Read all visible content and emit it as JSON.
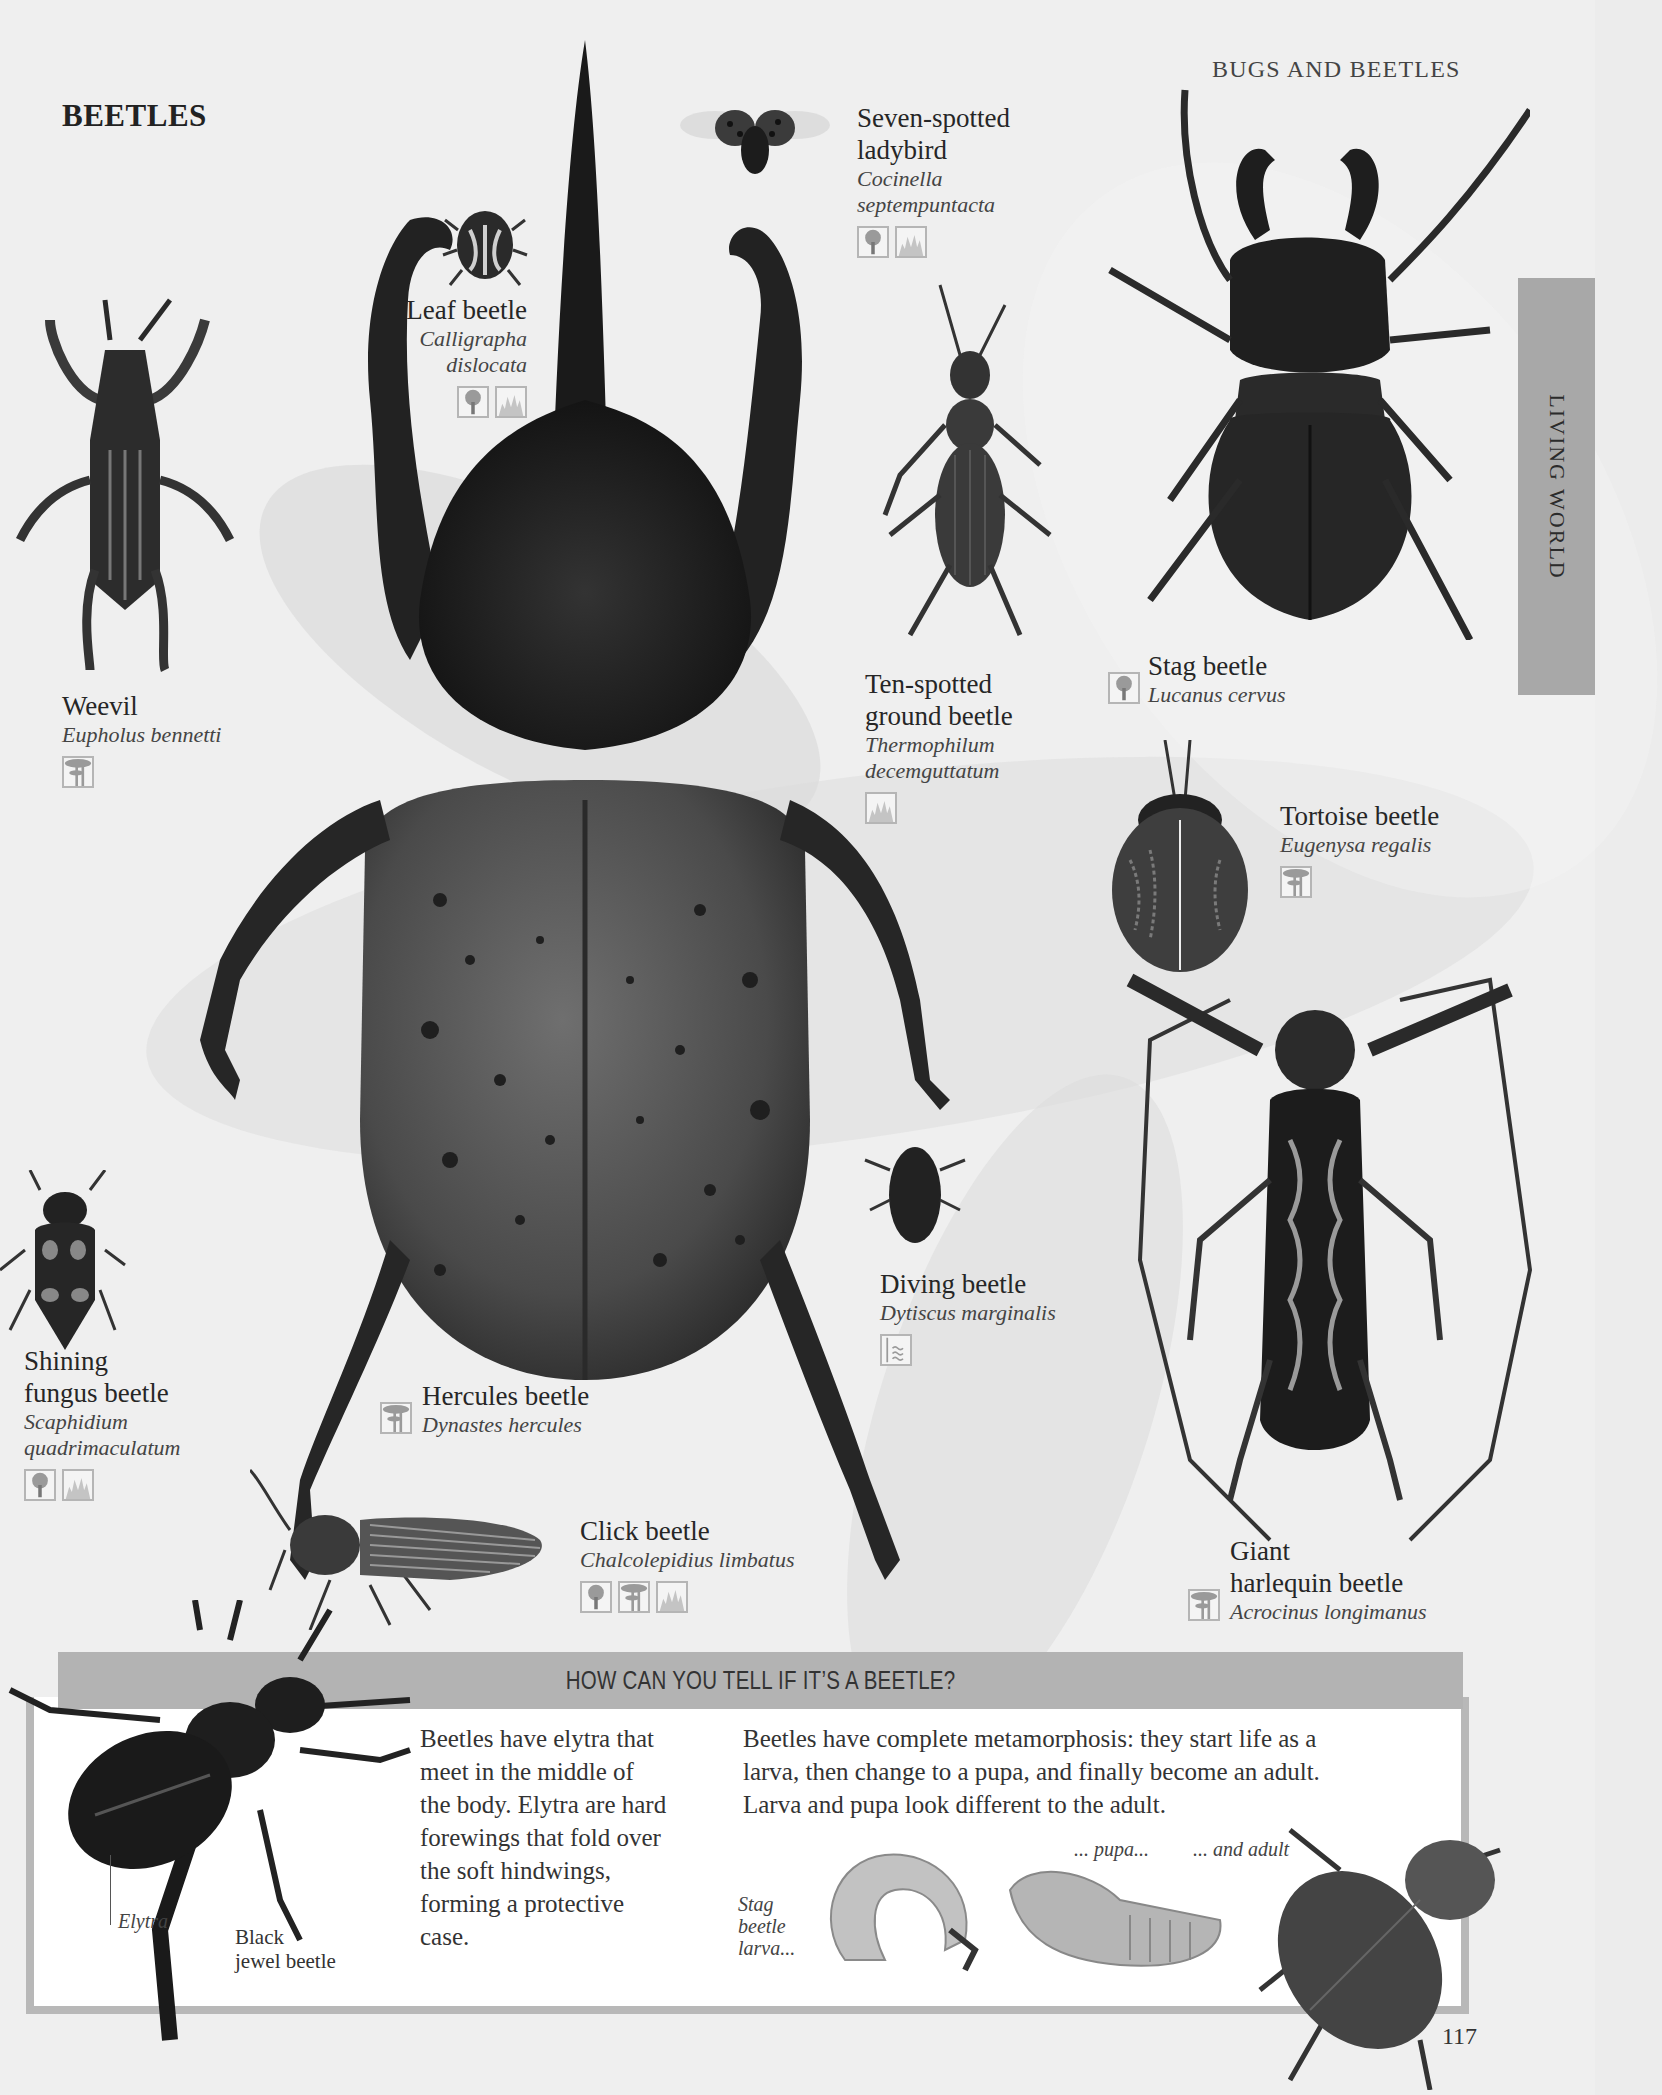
{
  "page": {
    "title": "BEETLES",
    "running_head": "BUGS AND BEETLES",
    "side_tab": "LIVING WORLD",
    "page_number": "117"
  },
  "species": [
    {
      "id": "seven-spotted-ladybird",
      "common": [
        "Seven-spotted",
        "ladybird"
      ],
      "latin": [
        "Cocinella",
        "septempuntacta"
      ],
      "habitats": [
        "woodland-icon",
        "grassland-icon"
      ]
    },
    {
      "id": "leaf-beetle",
      "common": [
        "Leaf beetle"
      ],
      "latin": [
        "Calligrapha",
        "dislocata"
      ],
      "habitats": [
        "woodland-icon",
        "grassland-icon"
      ]
    },
    {
      "id": "weevil",
      "common": [
        "Weevil"
      ],
      "latin": [
        "Eupholus bennetti"
      ],
      "habitats": [
        "rainforest-icon"
      ]
    },
    {
      "id": "ten-spotted-ground-beetle",
      "common": [
        "Ten-spotted",
        "ground beetle"
      ],
      "latin": [
        "Thermophilum",
        "decemguttatum"
      ],
      "habitats": [
        "grassland-icon"
      ]
    },
    {
      "id": "stag-beetle",
      "common": [
        "Stag beetle"
      ],
      "latin": [
        "Lucanus cervus"
      ],
      "habitats": [
        "woodland-icon"
      ]
    },
    {
      "id": "tortoise-beetle",
      "common": [
        "Tortoise beetle"
      ],
      "latin": [
        "Eugenysa regalis"
      ],
      "habitats": [
        "rainforest-icon"
      ]
    },
    {
      "id": "shining-fungus-beetle",
      "common": [
        "Shining",
        "fungus beetle"
      ],
      "latin": [
        "Scaphidium",
        "quadrimaculatum"
      ],
      "habitats": [
        "woodland-icon",
        "grassland-icon"
      ]
    },
    {
      "id": "hercules-beetle",
      "common": [
        "Hercules beetle"
      ],
      "latin": [
        "Dynastes hercules"
      ],
      "habitats": [
        "rainforest-icon"
      ]
    },
    {
      "id": "diving-beetle",
      "common": [
        "Diving beetle"
      ],
      "latin": [
        "Dytiscus marginalis"
      ],
      "habitats": [
        "freshwater-icon"
      ]
    },
    {
      "id": "click-beetle",
      "common": [
        "Click beetle"
      ],
      "latin": [
        "Chalcolepidius limbatus"
      ],
      "habitats": [
        "woodland-icon",
        "rainforest-icon",
        "grassland-icon"
      ]
    },
    {
      "id": "giant-harlequin-beetle",
      "common": [
        "Giant",
        "harlequin beetle"
      ],
      "latin": [
        "Acrocinus longimanus"
      ],
      "habitats": [
        "rainforest-icon"
      ]
    }
  ],
  "info_box": {
    "heading": "HOW CAN YOU TELL IF IT’S A BEETLE?",
    "left_text": [
      "Beetles have elytra that",
      "meet in the middle of",
      "the body. Elytra are hard",
      "forewings that fold over",
      "the soft hindwings,",
      "forming a protective",
      "case."
    ],
    "right_text": [
      "Beetles have complete metamorphosis: they start life as a",
      "larva, then change to a pupa, and finally become an adult.",
      "Larva and pupa look different to the adult."
    ],
    "labels": {
      "elytra": "Elytra",
      "black_jewel": [
        "Black",
        "jewel beetle"
      ],
      "larva": [
        "Stag",
        "beetle",
        "larva..."
      ],
      "pupa": "... pupa...",
      "adult": "... and adult"
    }
  },
  "colors": {
    "background": "#efefef",
    "tab": "#a8a8a8",
    "banner": "#b3b3b3",
    "frame": "#b8b8b8",
    "icon_fill": "#9a9a9a"
  }
}
